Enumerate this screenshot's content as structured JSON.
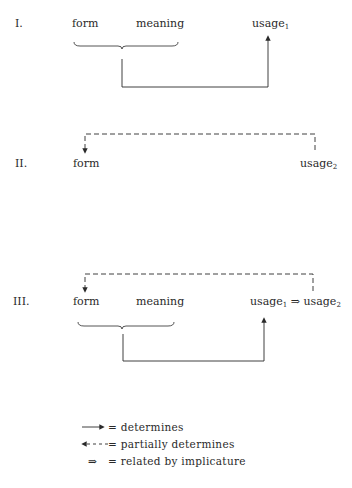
{
  "diagram_I": {
    "numeral": "I.",
    "form": "form",
    "meaning": "meaning",
    "usage": "usage",
    "usage_sub": "1"
  },
  "diagram_II": {
    "numeral": "II.",
    "form": "form",
    "usage": "usage",
    "usage_sub": "2"
  },
  "diagram_III": {
    "numeral": "III.",
    "form": "form",
    "meaning": "meaning",
    "usage1": "usage",
    "usage1_sub": "1",
    "implicature_symbol": "⇒",
    "usage2": "usage",
    "usage2_sub": "2"
  },
  "legend": {
    "items": [
      {
        "symbol": "solid-arrow",
        "label": "= determines"
      },
      {
        "symbol": "dashed-arrow",
        "label": "= partially determines"
      },
      {
        "symbol": "⇒",
        "label": "= related by implicature"
      }
    ]
  },
  "colors": {
    "ink": "#2a2a2a",
    "background": "#ffffff"
  }
}
